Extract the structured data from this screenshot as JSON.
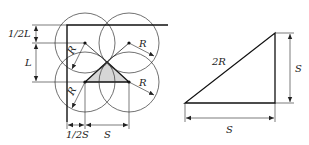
{
  "figure": {
    "left_diagram": {
      "name": "overlapping circles layout",
      "labels": {
        "half_L": "1/2L",
        "L": "L",
        "half_S": "1/2S",
        "S": "S",
        "R_top_left": "R",
        "R_top_right": "R",
        "R_bottom_left": "R",
        "R_bottom_right": "R"
      },
      "circles": [
        {
          "cx": 85,
          "cy": 43,
          "r": 30
        },
        {
          "cx": 129,
          "cy": 43,
          "r": 30
        },
        {
          "cx": 85,
          "cy": 82,
          "r": 30
        },
        {
          "cx": 129,
          "cy": 82,
          "r": 30
        }
      ],
      "shaded_triangle_fill": "#d6d6d6"
    },
    "right_diagram": {
      "name": "right triangle",
      "labels": {
        "hypotenuse": "2R",
        "vertical_side": "S",
        "horizontal_side": "S"
      }
    }
  }
}
